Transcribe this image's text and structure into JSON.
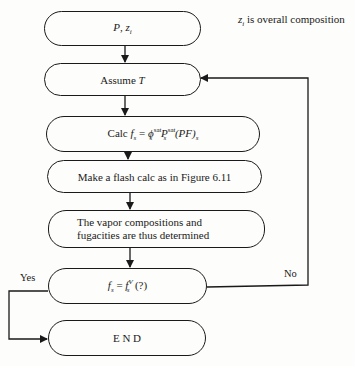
{
  "note": {
    "var": "z",
    "sub": "i",
    "text": " is overall composition"
  },
  "nodes": {
    "input": {
      "p": "P",
      "sep": ", ",
      "z": "z",
      "zsub": "i"
    },
    "assume": {
      "text": "Assume ",
      "var": "T"
    },
    "calc": {
      "prefix": "Calc ",
      "f": "f",
      "fsub": "s",
      "eq": " = ",
      "phi": "ϕ",
      "phisub": "s",
      "phisup": "sat",
      "P": " P",
      "Psub": "s",
      "Psup": "sat",
      "pf": " (PF)",
      "pfsub": "s"
    },
    "flash": {
      "text": "Make a flash calc as in Figure 6.11"
    },
    "vapor": {
      "line1": "The vapor compositions and",
      "line2": "fugacities are thus determined"
    },
    "decision": {
      "f": "f",
      "fsub": "s",
      "eq": " = ",
      "f2": "f",
      "f2sub": "s",
      "f2sup": "V",
      "q": "  (?)"
    },
    "end": {
      "text": "E N D"
    }
  },
  "edges": {
    "yes": "Yes",
    "no": "No"
  }
}
